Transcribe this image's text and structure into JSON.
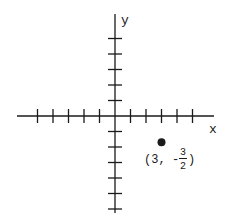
{
  "diagram": {
    "type": "coordinate-plane",
    "colors": {
      "ink": "#1a1a1a",
      "background": "#ffffff"
    },
    "axes": {
      "x_label": "x",
      "y_label": "y",
      "origin_px": [
        115,
        116
      ],
      "unit_px": 15.5,
      "x_ticks": [
        -5,
        -4,
        -3,
        -2,
        -1,
        1,
        2,
        3,
        4,
        5
      ],
      "y_ticks_positive": [
        1,
        2,
        3,
        4,
        5
      ],
      "y_ticks_negative": [
        -1,
        -2,
        -3,
        -4,
        -5,
        -6
      ]
    },
    "point": {
      "x": 3,
      "y": -1.5,
      "label_prefix": "(3,",
      "label_sign": "-",
      "frac_num": "3",
      "frac_den": "2",
      "label_suffix": ")"
    }
  }
}
